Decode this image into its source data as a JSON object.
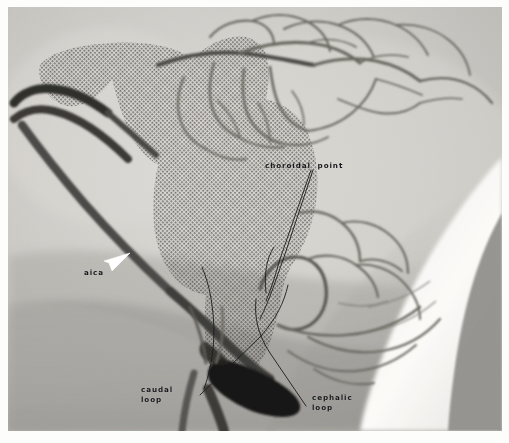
{
  "figure": {
    "type": "medical-angiogram",
    "modality": "cerebral angiogram, lateral projection",
    "background_color": "#ffffff",
    "film_base_color": "#c9c8c4",
    "stipple_color": "#2b2a28",
    "vessel_color": "#5d5b58",
    "annotation_color": "#17161a",
    "arrow_color": "#ffffff"
  },
  "annotations": [
    {
      "id": "choroidal-point",
      "label": "choroidal  point",
      "x": 257,
      "y": 154,
      "leader": "two-parallel-lines",
      "points_to": "choroidal point of the posterior inferior cerebellar artery"
    },
    {
      "id": "aica",
      "label": "aica",
      "x": 76,
      "y": 261,
      "leader": "white-arrowhead",
      "points_to": "anterior inferior cerebellar artery"
    },
    {
      "id": "caudal-loop",
      "label": "caudal\nloop",
      "x": 133,
      "y": 378,
      "leader": "single-line",
      "points_to": "caudal loop of the posterior inferior cerebellar artery"
    },
    {
      "id": "cephalic-loop",
      "label": "cephalic\nloop",
      "x": 304,
      "y": 386,
      "leader": "single-line",
      "points_to": "cephalic loop of the posterior inferior cerebellar artery"
    }
  ],
  "regions": {
    "stippled_overlay": "shaded halftone region outlining the cerebellum / brainstem territory",
    "bright_wedge": "bright white area, lower right of the film",
    "dark_wedge": "dark gray triangular wedge, far lower right corner",
    "dense_vessel": "dense opacified vessel / contrast column, lower centre"
  }
}
